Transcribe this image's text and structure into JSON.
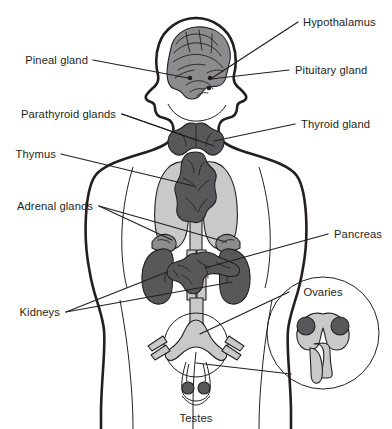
{
  "diagram": {
    "background": "#ffffff",
    "ink": "#231f20",
    "palette": {
      "ink": "#231f20",
      "organ_dark": "#58585b",
      "organ_mid": "#8c8c8f",
      "organ_light": "#c9c9c9",
      "organ_pale": "#d9d9d9",
      "white": "#ffffff"
    },
    "labels": {
      "hypothalamus": "Hypothalamus",
      "pituitary_gland": "Pituitary gland",
      "pineal_gland": "Pineal gland",
      "parathyroid_glands": "Parathyroid glands",
      "thyroid_gland": "Thyroid gland",
      "thymus": "Thymus",
      "adrenal_glands": "Adrenal glands",
      "pancreas": "Pancreas",
      "kidneys": "Kidneys",
      "ovaries": "Ovaries",
      "testes": "Testes"
    },
    "structures": [
      {
        "name": "brain",
        "label": "Pineal gland",
        "tone": "organ_mid"
      },
      {
        "name": "thyroid",
        "label": "Thyroid gland",
        "tone": "organ_dark"
      },
      {
        "name": "thymus",
        "label": "Thymus",
        "tone": "organ_dark"
      },
      {
        "name": "lungs",
        "label": "",
        "tone": "organ_light"
      },
      {
        "name": "adrenal-glands",
        "label": "Adrenal glands",
        "tone": "organ_mid"
      },
      {
        "name": "kidneys",
        "label": "Kidneys",
        "tone": "organ_dark"
      },
      {
        "name": "pancreas",
        "label": "Pancreas",
        "tone": "organ_dark"
      },
      {
        "name": "uterus-inset",
        "label": "Ovaries",
        "tone": "organ_light"
      },
      {
        "name": "testes",
        "label": "Testes",
        "tone": "organ_dark"
      }
    ]
  }
}
